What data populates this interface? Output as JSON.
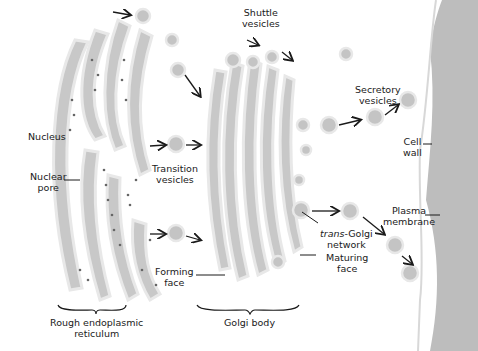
{
  "diagram": {
    "labels": {
      "nucleus": "Nucleus",
      "nuclear_pore_1": "Nuclear",
      "nuclear_pore_2": "pore",
      "transition_1": "Transition",
      "transition_2": "vesicles",
      "shuttle_1": "Shuttle",
      "shuttle_2": "vesicles",
      "secretory_1": "Secretory",
      "secretory_2": "vesicles",
      "cell_wall_1": "Cell",
      "cell_wall_2": "wall",
      "plasma_1": "Plasma",
      "plasma_2": "membrane",
      "trans_italic": "trans",
      "trans_rest": "-Golgi",
      "trans_2": "network",
      "maturing_1": "Maturing",
      "maturing_2": "face",
      "forming_1": "Forming",
      "forming_2": "face",
      "rer_1": "Rough endoplasmic",
      "rer_2": "reticulum",
      "golgi": "Golgi body"
    },
    "colors": {
      "organelle_fill": "#c8c8c8",
      "organelle_edge": "#e6e6e6",
      "wall": "#bdbdbd",
      "ink": "#1a1a1a"
    }
  }
}
